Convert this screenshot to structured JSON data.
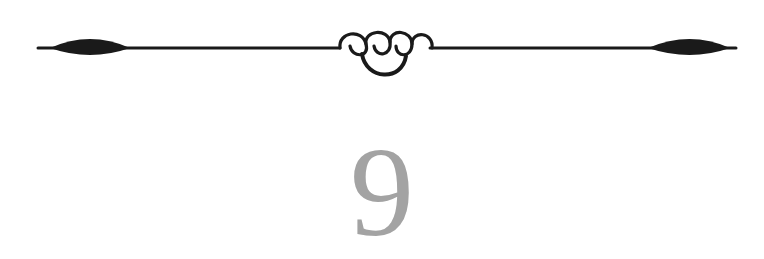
{
  "chapter": {
    "number": "9"
  },
  "colors": {
    "ornament": "#1a1a1a",
    "number": "#a3a3a3",
    "background": "#ffffff"
  },
  "icons": {
    "divider": "flourish-divider-icon"
  }
}
